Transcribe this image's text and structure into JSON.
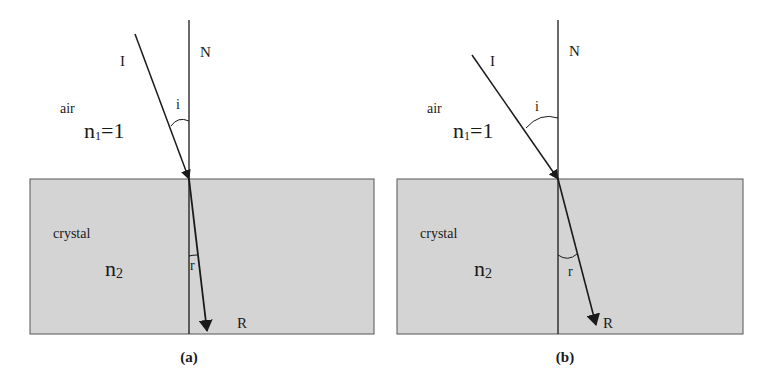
{
  "panels": [
    {
      "id": "a",
      "caption": "(a)",
      "normal_label": "N",
      "incident_label": "I",
      "refracted_label": "R",
      "incidence_angle_label": "i",
      "refraction_angle_label": "r",
      "medium1_name": "air",
      "medium1_index": "n",
      "medium1_index_sub": "1",
      "medium1_index_value": "=1",
      "medium2_name": "crystal",
      "medium2_index": "n",
      "medium2_index_sub": "2"
    },
    {
      "id": "b",
      "caption": "(b)",
      "normal_label": "N",
      "incident_label": "I",
      "refracted_label": "R",
      "incidence_angle_label": "i",
      "refraction_angle_label": "r",
      "medium1_name": "air",
      "medium1_index": "n",
      "medium1_index_sub": "1",
      "medium1_index_value": "=1",
      "medium2_name": "crystal",
      "medium2_index": "n",
      "medium2_index_sub": "2"
    }
  ],
  "colors": {
    "crystal_fill": "#d4d4d4",
    "line": "#1a1a1a"
  }
}
